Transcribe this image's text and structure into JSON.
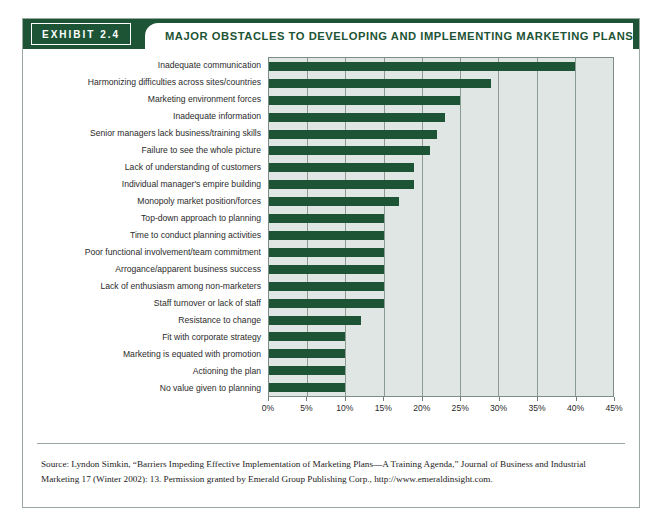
{
  "exhibit": {
    "tab_label": "EXHIBIT  2.4",
    "title": "MAJOR OBSTACLES TO DEVELOPING AND IMPLEMENTING MARKETING PLANS",
    "source_note": "Source: Lyndon Simkin, “Barriers Impeding Effective Implementation of Marketing Plans—A Training Agenda,” Journal of Business and Industrial Marketing 17 (Winter 2002): 13. Permission granted by Emerald Group Publishing Corp., http://www.emeraldinsight.com."
  },
  "colors": {
    "bar_green": "#1d5435",
    "header_green": "#1d5435",
    "plot_background": "#dfe6e3",
    "gridline": "#8d9b95",
    "card_border": "#9aa8a2"
  },
  "chart_data": {
    "type": "bar",
    "orientation": "horizontal",
    "title": "MAJOR OBSTACLES TO DEVELOPING AND IMPLEMENTING MARKETING PLANS",
    "xlabel": "",
    "ylabel": "",
    "xlim": [
      0,
      45
    ],
    "xticks": [
      0,
      5,
      10,
      15,
      20,
      25,
      30,
      35,
      40,
      45
    ],
    "xtick_labels": [
      "0%",
      "5%",
      "10%",
      "15%",
      "20%",
      "25%",
      "30%",
      "35%",
      "40%",
      "45%"
    ],
    "grid": true,
    "legend": false,
    "value_unit": "%",
    "categories": [
      "Inadequate communication",
      "Harmonizing difficulties across sites/countries",
      "Marketing environment forces",
      "Inadequate information",
      "Senior managers lack business/training skills",
      "Failure to see the whole picture",
      "Lack of understanding of customers",
      "Individual manager's empire building",
      "Monopoly market position/forces",
      "Top-down approach to planning",
      "Time to conduct planning activities",
      "Poor functional involvement/team commitment",
      "Arrogance/apparent business success",
      "Lack of enthusiasm among non-marketers",
      "Staff turnover or lack of staff",
      "Resistance to change",
      "Fit with corporate strategy",
      "Marketing is equated with promotion",
      "Actioning the plan",
      "No value given to planning"
    ],
    "values": [
      40,
      29,
      25,
      23,
      22,
      21,
      19,
      19,
      17,
      15,
      15,
      15,
      15,
      15,
      15,
      12,
      10,
      10,
      10,
      10
    ]
  }
}
